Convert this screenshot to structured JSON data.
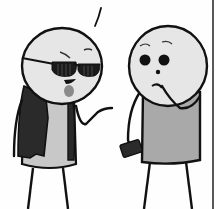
{
  "panel": {
    "description": "Comic panel: two stick-figure characters talking",
    "colors": {
      "background": "#fefefe",
      "outline": "#111111",
      "skin": "#e6e6e6",
      "shirt_left": "#c8c8c8",
      "jacket": "#2a2a2a",
      "shirt_right": "#a9a9a9",
      "glasses": "#1a1a1a",
      "phone": "#2b2b2b",
      "goatee": "#8a8a8a",
      "border": "#222222"
    }
  },
  "characters": [
    {
      "name": "Cool guy",
      "features": [
        "sunglasses",
        "goatee",
        "leather jacket",
        "shrugging hand"
      ]
    },
    {
      "name": "Nervous guy",
      "features": [
        "wide eyes",
        "hand to mouth",
        "holding phone"
      ]
    }
  ]
}
